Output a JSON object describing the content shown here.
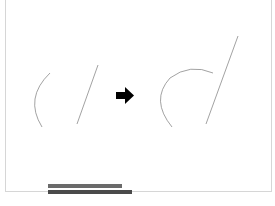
{
  "figure": {
    "left_panel": {
      "arc": {
        "start": [
          50,
          73
        ],
        "mid": [
          31,
          100
        ],
        "end": [
          42,
          127
        ]
      },
      "line": {
        "start": [
          98,
          65
        ],
        "end": [
          77,
          124
        ]
      }
    },
    "arrow": {
      "icon": "right-arrow",
      "color": "#000000",
      "x": 116,
      "y": 96
    },
    "right_panel": {
      "arc": {
        "start": [
          213,
          73
        ],
        "top": [
          190,
          70
        ],
        "mid": [
          160,
          100
        ],
        "end": [
          172,
          127
        ]
      },
      "line": {
        "start": [
          238,
          36
        ],
        "end": [
          206,
          124
        ]
      }
    },
    "stroke_color": "#8a8a8a",
    "frame_color": "#d6d6d6"
  },
  "caption": {
    "line1": "",
    "line2": ""
  }
}
